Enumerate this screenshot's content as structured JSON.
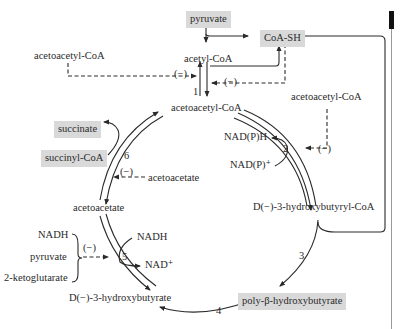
{
  "diagram": {
    "nodes": {
      "pyruvate_top": "pyruvate",
      "coa_sh": "CoA-SH",
      "acetyl_coa": "acetyl-CoA",
      "acetoacetyl_coa_left": "acetoacetyl-CoA",
      "acetoacetyl_coa_center": "acetoacetyl-CoA",
      "acetoacetyl_coa_right": "acetoacetyl-CoA",
      "succinate": "succinate",
      "succinyl_coa": "succinyl-CoA",
      "acetoacetate_inhibitor": "acetoacetate",
      "acetoacetate": "acetoacetate",
      "nadph": "NAD(P)H",
      "nadp_plus": "NAD(P)⁺",
      "hydroxybutyryl_coa": "D(−)-3-hydroxybutyryl-CoA",
      "nadh_left": "NADH",
      "pyruvate_left": "pyruvate",
      "ketoglutarate": "2-ketoglutarate",
      "nadh_right": "NADH",
      "nad_plus": "NAD⁺",
      "hydroxybutyrate": "D(−)-3-hydroxybutyrate",
      "phb": "poly-β-hydroxybutyrate"
    },
    "inhibition_label": "(−)",
    "steps": [
      "1",
      "2",
      "3",
      "4",
      "5",
      "6"
    ],
    "colors": {
      "highlight_box": "#d9d9d9",
      "line": "#2a2a2a"
    }
  }
}
